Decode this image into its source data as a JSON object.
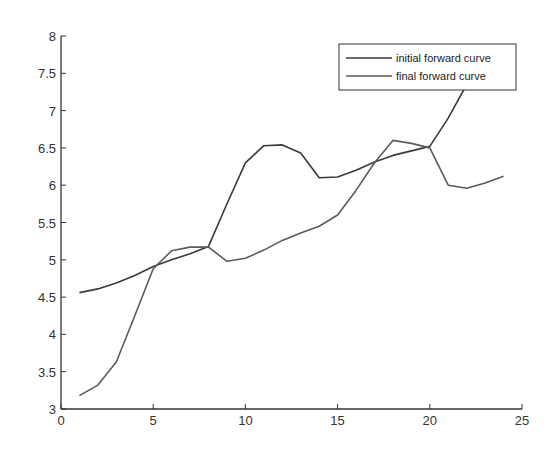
{
  "chart_data": {
    "type": "line",
    "title": "",
    "xlabel": "",
    "ylabel": "",
    "xlim": [
      0,
      25
    ],
    "ylim": [
      3,
      8
    ],
    "grid": false,
    "legend_position": "upper right",
    "x_ticks": [
      0,
      5,
      10,
      15,
      20,
      25
    ],
    "y_ticks": [
      3,
      3.5,
      4,
      4.5,
      5,
      5.5,
      6,
      6.5,
      7,
      7.5,
      8
    ],
    "x_tick_labels": [
      "0",
      "5",
      "10",
      "15",
      "20",
      "25"
    ],
    "y_tick_labels": [
      "3",
      "3.5",
      "4",
      "4.5",
      "5",
      "5.5",
      "6",
      "6.5",
      "7",
      "7.5",
      "8"
    ],
    "x": [
      1,
      2,
      3,
      4,
      5,
      6,
      7,
      8,
      9,
      10,
      11,
      12,
      13,
      14,
      15,
      16,
      17,
      18,
      19,
      20,
      21,
      22,
      23,
      24
    ],
    "series": [
      {
        "name": "initial forward curve",
        "color": "#3a3a3a",
        "x": [
          1,
          2,
          3,
          4,
          5,
          6,
          7,
          8,
          9,
          10,
          11,
          12,
          13,
          14,
          15,
          16,
          17,
          18,
          19,
          20,
          21,
          22,
          23
        ],
        "values": [
          4.56,
          4.61,
          4.69,
          4.79,
          4.91,
          5.0,
          5.08,
          5.18,
          5.75,
          6.3,
          6.53,
          6.54,
          6.43,
          6.1,
          6.11,
          6.2,
          6.31,
          6.4,
          6.46,
          6.52,
          6.9,
          7.35,
          7.8
        ]
      },
      {
        "name": "final forward curve",
        "color": "#5a5a5a",
        "x": [
          1,
          2,
          3,
          4,
          5,
          6,
          7,
          8,
          9,
          10,
          11,
          12,
          13,
          14,
          15,
          16,
          17,
          18,
          19,
          20,
          21,
          22,
          23,
          24
        ],
        "values": [
          3.18,
          3.32,
          3.63,
          4.25,
          4.88,
          5.12,
          5.17,
          5.17,
          4.98,
          5.02,
          5.13,
          5.26,
          5.36,
          5.45,
          5.6,
          5.93,
          6.3,
          6.6,
          6.56,
          6.5,
          6.0,
          5.96,
          6.03,
          6.12
        ]
      }
    ]
  },
  "legend": {
    "items": [
      {
        "label": "initial forward curve",
        "color": "#3a3a3a"
      },
      {
        "label": "final forward curve",
        "color": "#5a5a5a"
      }
    ]
  }
}
